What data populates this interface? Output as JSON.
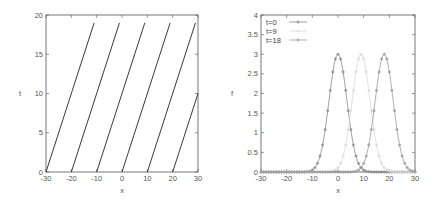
{
  "chart_data": [
    {
      "type": "line",
      "title": "",
      "xlabel": "x",
      "ylabel": "t",
      "xlim": [
        -30,
        30
      ],
      "ylim": [
        0,
        20
      ],
      "xticks": [
        "-30",
        "-20",
        "-10",
        "0",
        "10",
        "20",
        "30"
      ],
      "yticks": [
        "0",
        "5",
        "10",
        "15",
        "20"
      ],
      "grid": false,
      "legend": null,
      "series": [
        {
          "name": "characteristic x0=-30",
          "x": [
            -30,
            -11
          ],
          "y": [
            0,
            19
          ]
        },
        {
          "name": "characteristic x0=-20",
          "x": [
            -20,
            -1
          ],
          "y": [
            0,
            19
          ]
        },
        {
          "name": "characteristic x0=-10",
          "x": [
            -10,
            9
          ],
          "y": [
            0,
            19
          ]
        },
        {
          "name": "characteristic x0=0",
          "x": [
            0,
            19
          ],
          "y": [
            0,
            19
          ]
        },
        {
          "name": "characteristic x0=10",
          "x": [
            10,
            29
          ],
          "y": [
            0,
            19
          ]
        },
        {
          "name": "characteristic x0=20",
          "x": [
            20,
            30
          ],
          "y": [
            0,
            10
          ]
        }
      ]
    },
    {
      "type": "line",
      "title": "",
      "xlabel": "x",
      "ylabel": "f",
      "xlim": [
        -30,
        30
      ],
      "ylim": [
        0,
        4
      ],
      "xticks": [
        "-30",
        "-20",
        "-10",
        "0",
        "10",
        "20",
        "30"
      ],
      "yticks": [
        "0",
        "0.5",
        "1",
        "1.5",
        "2",
        "2.5",
        "3",
        "3.5",
        "4"
      ],
      "grid": false,
      "legend_position": "top-left",
      "series": [
        {
          "name": "t=0",
          "peak_x": 0,
          "peak_y": 3,
          "sigma": 3.5,
          "color": "#888888"
        },
        {
          "name": "t=9",
          "peak_x": 9,
          "peak_y": 3,
          "sigma": 3.5,
          "color": "#d8d8d8"
        },
        {
          "name": "t=18",
          "peak_x": 18,
          "peak_y": 3,
          "sigma": 3.5,
          "color": "#999999"
        }
      ]
    }
  ],
  "left": {
    "xlabel": "x",
    "ylabel": "t",
    "xticks": [
      "-30",
      "-20",
      "-10",
      "0",
      "10",
      "20",
      "30"
    ],
    "yticks": [
      "0",
      "5",
      "10",
      "15",
      "20"
    ]
  },
  "right": {
    "xlabel": "x",
    "ylabel": "f",
    "xticks": [
      "-30",
      "-20",
      "-10",
      "0",
      "10",
      "20",
      "30"
    ],
    "yticks": [
      "0",
      "0.5",
      "1",
      "1.5",
      "2",
      "2.5",
      "3",
      "3.5",
      "4"
    ],
    "legend": [
      "t=0",
      "t=9",
      "t=18"
    ]
  }
}
